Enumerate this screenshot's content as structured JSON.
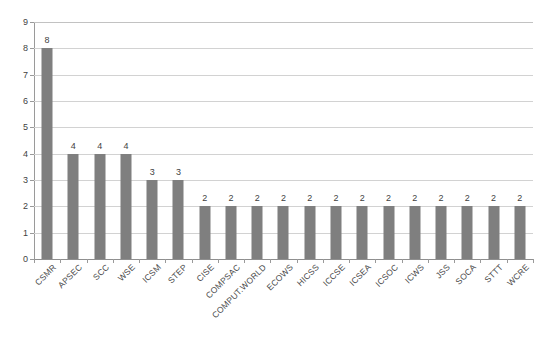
{
  "chart_data": {
    "type": "bar",
    "title": "",
    "subtitle": "",
    "xlabel": "",
    "ylabel": "",
    "ylim": [
      0,
      9
    ],
    "y_ticks": [
      0,
      1,
      2,
      3,
      4,
      5,
      6,
      7,
      8,
      9
    ],
    "grid": true,
    "legend": false,
    "legend_position": "none",
    "orientation": "vertical",
    "bar_color": "#7f7f7f",
    "gridline_color": "#d2d2d2",
    "background_color": "#ffffff",
    "label_rotation_degrees": -45,
    "show_value_labels": true,
    "categories": [
      "CSMR",
      "APSEC",
      "SCC",
      "WSE",
      "ICSM",
      "STEP",
      "CISE",
      "COMPSAC",
      "COMPUT.WORLD",
      "ECOWS",
      "HICSS",
      "ICCSE",
      "ICSEA",
      "ICSOC",
      "ICWS",
      "JSS",
      "SOCA",
      "STTT",
      "WCRE"
    ],
    "values": [
      8,
      4,
      4,
      4,
      3,
      3,
      2,
      2,
      2,
      2,
      2,
      2,
      2,
      2,
      2,
      2,
      2,
      2,
      2
    ],
    "value_labels": [
      "8",
      "4",
      "4",
      "4",
      "3",
      "3",
      "2",
      "2",
      "2",
      "2",
      "2",
      "2",
      "2",
      "2",
      "2",
      "2",
      "2",
      "2",
      "2"
    ],
    "y_tick_labels": [
      "0",
      "1",
      "2",
      "3",
      "4",
      "5",
      "6",
      "7",
      "8",
      "9"
    ]
  }
}
